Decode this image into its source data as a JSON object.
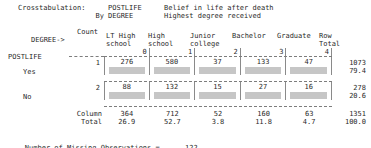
{
  "header": {
    "crosstab_label": "Crosstabulation:",
    "by_label": "By",
    "row_var": "POSTLIFE",
    "row_var_desc": "Belief in life after death",
    "col_var": "DEGREE",
    "col_var_desc": "Highest degree received"
  },
  "table": {
    "count_caption": "Count",
    "col_var_arrow": "DEGREE->",
    "row_var_name": "POSTLIFE",
    "column_headers": [
      {
        "line1": "LT High",
        "line2": "school",
        "code": "0"
      },
      {
        "line1": "High",
        "line2": "school",
        "code": "1"
      },
      {
        "line1": "Junior",
        "line2": "college",
        "code": "2"
      },
      {
        "line1": "Bachelor",
        "line2": "",
        "code": "3"
      },
      {
        "line1": "Graduate",
        "line2": "",
        "code": "4"
      }
    ],
    "row_total_header": {
      "line1": "Row",
      "line2": "Total"
    },
    "rows": [
      {
        "code": "1",
        "label": "Yes",
        "counts": [
          "276",
          "580",
          "37",
          "133",
          "47"
        ],
        "row_total": "1073",
        "row_pct": "79.4"
      },
      {
        "code": "2",
        "label": "No",
        "counts": [
          "88",
          "132",
          "15",
          "27",
          "16"
        ],
        "row_total": "278",
        "row_pct": "20.6"
      }
    ],
    "column_total": {
      "label_line1": "Column",
      "label_line2": "Total",
      "counts": [
        "364",
        "712",
        "52",
        "160",
        "63"
      ],
      "pcts": [
        "26.9",
        "52.7",
        "3.8",
        "11.8",
        "4.7"
      ],
      "grand_total": "1351",
      "grand_pct": "100.0"
    }
  },
  "footer": {
    "missing_label": "Number of Missing Observations =",
    "missing_value": "122"
  },
  "colors": {
    "text": "#2a2a2a",
    "redaction_bar": "#c6c6c6",
    "rule": "#7d7d7d",
    "background": "#ffffff"
  }
}
